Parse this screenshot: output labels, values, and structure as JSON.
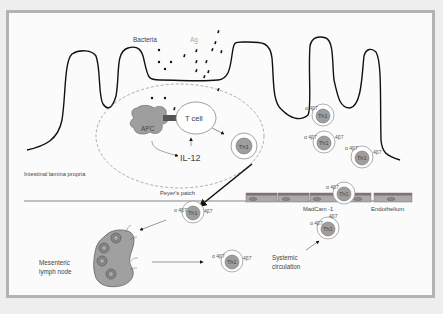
{
  "diagram": {
    "type": "immunology-schematic",
    "colors": {
      "frame_border": "#b3b3b3",
      "background": "#fbfbfb",
      "cell_fill": "#9e9e9e",
      "line": "#111111"
    },
    "labels": {
      "bacteria": "Bacteria",
      "antigen": "Ag",
      "apc": "APC",
      "t_cell": "T cell",
      "il12": "IL-12",
      "peyers_patch": "Peyer's patch",
      "lamina_propria": "Intestinal lamina propria",
      "madcam": "MadCam -1",
      "endothelium": "Endothelium",
      "lymph_node_line1": "Mesenteric",
      "lymph_node_line2": "lymph node",
      "systemic_line1": "Systemic",
      "systemic_line2": "circulation"
    },
    "th1_cells": [
      {
        "id": "th1-peyers",
        "label": "Th1",
        "integrin_left": "",
        "integrin_right": ""
      },
      {
        "id": "th1-lp-1",
        "label": "Th1",
        "integrin_left": "α 4β7",
        "integrin_right": ""
      },
      {
        "id": "th1-lp-2",
        "label": "Th1",
        "integrin_left": "α 4β7",
        "integrin_right": "4β7"
      },
      {
        "id": "th1-lp-3",
        "label": "Th1",
        "integrin_left": "α 4β7",
        "integrin_right": "4β7"
      },
      {
        "id": "th1-endothelium",
        "label": "Th1",
        "integrin_left": "α 4β7",
        "integrin_right": ""
      },
      {
        "id": "th1-exit",
        "label": "Th1",
        "integrin_left": "α 4β7",
        "integrin_right": "4β7"
      },
      {
        "id": "th1-circulating",
        "label": "Th1",
        "integrin_left": "α 4β7",
        "integrin_right": "4β7"
      },
      {
        "id": "th1-systemic",
        "label": "Th1",
        "integrin_left": "α 4β7",
        "integrin_right": "4β7"
      }
    ]
  }
}
